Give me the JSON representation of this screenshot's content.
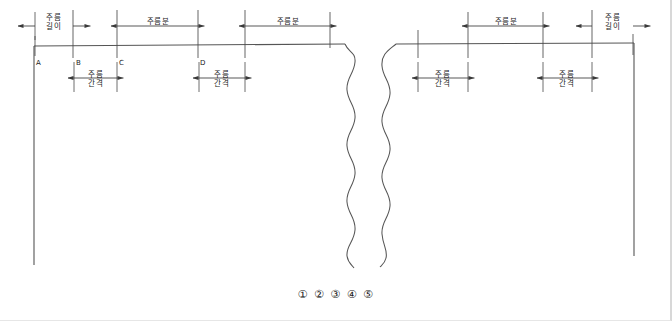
{
  "diagram": {
    "stroke_color": "#3a3a3a",
    "background_color": "#ffffff",
    "border_color": "#d8d8d8",
    "point_labels": [
      {
        "id": "A",
        "text": "A",
        "x": 34,
        "y": 66
      },
      {
        "id": "B",
        "text": "B",
        "x": 74,
        "y": 66
      },
      {
        "id": "C",
        "text": "C",
        "x": 118,
        "y": 66
      },
      {
        "id": "D",
        "text": "D",
        "x": 199,
        "y": 66
      }
    ],
    "top_dimensions": [
      {
        "id": "pleat-length-left",
        "text": "주름\n길이",
        "x1": 35,
        "x2": 73,
        "label_x": 54,
        "label_y": 14
      },
      {
        "id": "pleat-allowance-left-1",
        "text": "주름분",
        "x1": 117,
        "x2": 198,
        "label_x": 158,
        "label_y": 17
      },
      {
        "id": "pleat-allowance-left-2",
        "text": "주름분",
        "x1": 245,
        "x2": 330,
        "label_x": 288,
        "label_y": 17
      },
      {
        "id": "pleat-allowance-right-1",
        "text": "주름분",
        "x1": 468,
        "x2": 543,
        "label_x": 506,
        "label_y": 17
      },
      {
        "id": "pleat-length-right",
        "text": "주름\n길이",
        "x1": 592,
        "x2": 633,
        "label_x": 613,
        "label_y": 14
      }
    ],
    "bottom_dimensions": [
      {
        "id": "pleat-interval-left-1",
        "text": "주름\n간격",
        "x1": 74,
        "x2": 117,
        "label_x": 96,
        "label_y": 72
      },
      {
        "id": "pleat-interval-left-2",
        "text": "주름\n간격",
        "x1": 199,
        "x2": 245,
        "label_x": 222,
        "label_y": 72
      },
      {
        "id": "pleat-interval-right-1",
        "text": "주름\n간격",
        "x1": 418,
        "x2": 468,
        "label_x": 443,
        "label_y": 72
      },
      {
        "id": "pleat-interval-right-2",
        "text": "주름\n간격",
        "x1": 543,
        "x2": 592,
        "label_x": 568,
        "label_y": 72
      }
    ],
    "circled_numbers": "① ② ③ ④ ⑤",
    "break_lines": {
      "count": 2,
      "description": "wavy-break-lines"
    }
  }
}
